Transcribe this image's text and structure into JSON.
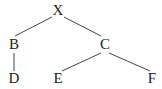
{
  "diagram": {
    "type": "tree",
    "colors": {
      "edge": "#444444",
      "text": "#222222",
      "background": "#ffffff"
    },
    "nodes": [
      {
        "id": "X",
        "label": "X",
        "x": 58,
        "y": 12
      },
      {
        "id": "B",
        "label": "B",
        "x": 14,
        "y": 46
      },
      {
        "id": "C",
        "label": "C",
        "x": 105,
        "y": 46
      },
      {
        "id": "D",
        "label": "D",
        "x": 14,
        "y": 80
      },
      {
        "id": "E",
        "label": "E",
        "x": 58,
        "y": 80
      },
      {
        "id": "F",
        "label": "F",
        "x": 152,
        "y": 80
      }
    ],
    "edges": [
      {
        "from": "X",
        "to": "B"
      },
      {
        "from": "X",
        "to": "C"
      },
      {
        "from": "B",
        "to": "D"
      },
      {
        "from": "C",
        "to": "E"
      },
      {
        "from": "C",
        "to": "F"
      }
    ]
  }
}
